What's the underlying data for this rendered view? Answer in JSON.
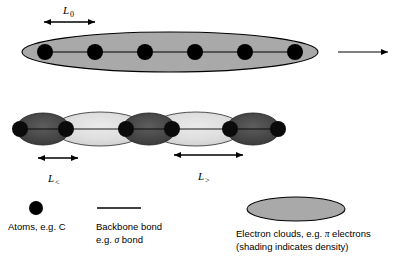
{
  "figure": {
    "colors": {
      "background": "#ffffff",
      "outline": "#000000",
      "atom": "#000000",
      "uniform_cloud": "#a9a9a9",
      "dense_cloud": "#4d4d4d",
      "sparse_cloud": "#dcdcdc",
      "legend_cloud": "#a9a9a9"
    }
  },
  "top_chain": {
    "name": "uniform-chain",
    "atom_count": 6,
    "atom_label": "C",
    "length_label": {
      "symbol": "L",
      "subscript": "0",
      "full": "L0"
    },
    "has_continuation_arrow": true
  },
  "middle_chain": {
    "name": "alternating-chain",
    "atom_count": 6,
    "bond_count": 5,
    "short_bond_label": {
      "symbol": "L",
      "subscript": "<",
      "full": "L<"
    },
    "long_bond_label": {
      "symbol": "L",
      "subscript": ">",
      "full": "L>"
    },
    "cloud_sequence": [
      "dense",
      "sparse",
      "dense",
      "sparse",
      "dense"
    ]
  },
  "legend": {
    "atoms": {
      "symbol": "filled-circle",
      "line1": "Atoms, e.g. C"
    },
    "bond": {
      "symbol": "horizontal-line",
      "line1": "Backbone bond",
      "line2_pre": "e.g. ",
      "line2_greek": "σ",
      "line2_post": " bond"
    },
    "clouds": {
      "symbol": "gray-ellipse",
      "line1_pre": "Electron clouds, e.g. ",
      "line1_greek": "π",
      "line1_post": " electrons",
      "line2": "(shading indicates density)"
    }
  }
}
